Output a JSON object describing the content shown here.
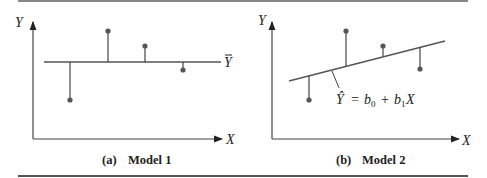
{
  "panels": [
    {
      "id": "a",
      "caption_letter": "(a)",
      "caption_title": "Model 1",
      "y_axis_label": "Y",
      "x_axis_label": "X",
      "line_label": "Ȳ",
      "line_type": "horizontal mean line"
    },
    {
      "id": "b",
      "caption_letter": "(b)",
      "caption_title": "Model 2",
      "y_axis_label": "Y",
      "x_axis_label": "X",
      "line_label": "Ŷ = b0 + b1X",
      "line_label_parts": {
        "yhat": "Ŷ",
        "eq": "=",
        "b0": "b",
        "sub0": "0",
        "plus": "+",
        "b1": "b",
        "sub1": "1",
        "x": "X"
      },
      "line_type": "sloped regression line"
    }
  ],
  "colors": {
    "ink": "#222222",
    "line": "#555555",
    "point": "#555555"
  }
}
